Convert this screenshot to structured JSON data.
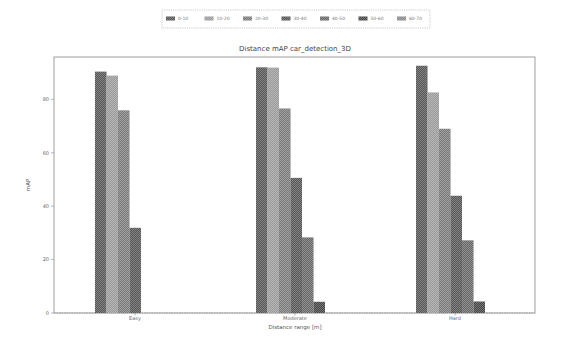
{
  "chart_data": {
    "type": "bar",
    "title": "Distance mAP car_detection_3D",
    "xlabel": "Distance range [m]",
    "ylabel": "mAP",
    "categories": [
      "Easy",
      "Moderate",
      "Hard"
    ],
    "ylim": [
      0,
      95
    ],
    "yticks": [
      0,
      20,
      40,
      60,
      80
    ],
    "grid": false,
    "legend_position": "top-center",
    "series": [
      {
        "name": "0-10",
        "color": "#555555",
        "values": [
          90.4,
          92.0,
          92.6
        ]
      },
      {
        "name": "10-20",
        "color": "#9a9a9a",
        "values": [
          88.9,
          91.9,
          82.6
        ]
      },
      {
        "name": "20-30",
        "color": "#7a7a7a",
        "values": [
          75.9,
          76.6,
          69.0
        ]
      },
      {
        "name": "30-40",
        "color": "#555555",
        "values": [
          31.9,
          50.6,
          43.9
        ]
      },
      {
        "name": "40-50",
        "color": "#666666",
        "values": [
          0,
          28.3,
          27.2
        ]
      },
      {
        "name": "50-60",
        "color": "#444444",
        "values": [
          0,
          4.2,
          4.3
        ]
      },
      {
        "name": "60-70",
        "color": "#888888",
        "values": [
          0,
          0,
          0
        ]
      }
    ]
  }
}
